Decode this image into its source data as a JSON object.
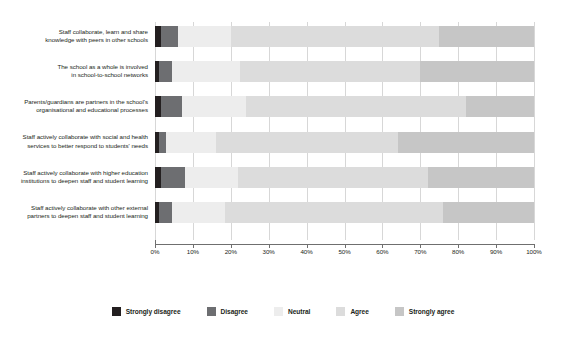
{
  "chart_data": {
    "type": "bar",
    "orientation": "horizontal",
    "stacked": true,
    "stacked_mode": "percent",
    "title": "",
    "subtitle": "",
    "xlabel": "",
    "ylabel": "",
    "xlim": [
      0,
      100
    ],
    "grid": true,
    "legend_position": "bottom",
    "xticks": [
      0,
      10,
      20,
      30,
      40,
      50,
      60,
      70,
      80,
      90,
      100
    ],
    "xtick_labels": [
      "0%",
      "10%",
      "20%",
      "30%",
      "40%",
      "50%",
      "60%",
      "70%",
      "80%",
      "90%",
      "100%"
    ],
    "categories": [
      "Staff collaborate, learn and share knowledge with peers in other schools",
      "The school as a whole is involved in school-to-school networks",
      "Parents/guardians are partners in the school's organisational and educational processes",
      "Staff actively collaborate with social and health services to better respond to students' needs",
      "Staff actively collaborate with higher education institutions to deepen staff and student learning",
      "Staff actively collaborate with other external partners to deepen staff and student learning"
    ],
    "category_lines": [
      [
        "Staff collaborate, learn and share",
        "knowledge with peers in other schools"
      ],
      [
        "The school as a whole is involved",
        "in school-to-school networks"
      ],
      [
        "Parents/guardians are partners in the school's",
        "organisational and educational processes"
      ],
      [
        "Staff actively collaborate with social and health",
        "services to better respond to students' needs"
      ],
      [
        "Staff actively collaborate with higher education",
        "institutions to deepen staff and student learning"
      ],
      [
        "Staff actively collaborate with other external",
        "partners to deepen staff and student learning"
      ]
    ],
    "series": [
      {
        "name": "Strongly disagree",
        "color": "#231f20",
        "values": [
          1.5,
          1.0,
          1.5,
          1.0,
          1.5,
          1.0
        ]
      },
      {
        "name": "Disagree",
        "color": "#6d6e71",
        "values": [
          4.5,
          3.5,
          5.5,
          2.0,
          6.5,
          3.5
        ]
      },
      {
        "name": "Neutral",
        "color": "#ededed",
        "values": [
          14.0,
          18.0,
          17.0,
          13.0,
          14.0,
          14.0
        ]
      },
      {
        "name": "Agree",
        "color": "#dcdcdc",
        "values": [
          55.0,
          47.5,
          58.0,
          48.0,
          50.0,
          57.5
        ]
      },
      {
        "name": "Strongly agree",
        "color": "#c6c6c6",
        "values": [
          25.0,
          30.0,
          18.0,
          36.0,
          28.0,
          24.0
        ]
      }
    ]
  },
  "legend": {
    "items": [
      {
        "label": "Strongly disagree",
        "color": "#231f20"
      },
      {
        "label": "Disagree",
        "color": "#6d6e71"
      },
      {
        "label": "Neutral",
        "color": "#ededed"
      },
      {
        "label": "Agree",
        "color": "#dcdcdc"
      },
      {
        "label": "Strongly agree",
        "color": "#c6c6c6"
      }
    ]
  }
}
